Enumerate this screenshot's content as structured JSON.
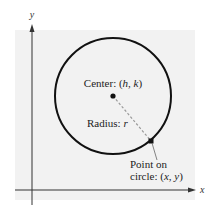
{
  "diagram": {
    "type": "circle-standard-form",
    "colors": {
      "background_panel": "#f2f2f2",
      "circle_stroke": "#111111",
      "axis": "#333333",
      "radius_dash": "#9a9a9a",
      "text": "#222222"
    },
    "axes": {
      "x_label": "x",
      "y_label": "y"
    },
    "center_label": {
      "prefix": "Center: (",
      "h": "h",
      "sep": ", ",
      "k": "k",
      "suffix": ")"
    },
    "radius_label": {
      "prefix": "Radius: ",
      "r": "r"
    },
    "point_label": {
      "line1": "Point on",
      "line2_prefix": "circle: (",
      "x": "x",
      "sep": ", ",
      "y": "y",
      "line2_suffix": ")"
    }
  }
}
